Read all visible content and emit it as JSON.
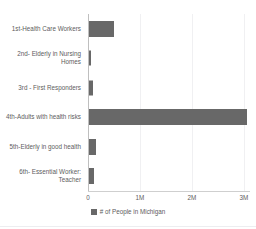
{
  "chart_data": {
    "type": "bar",
    "orientation": "horizontal",
    "title": "",
    "xlabel": "",
    "ylabel": "",
    "categories": [
      "1st-Health Care Workers",
      "2nd- Elderly in Nursing Homes",
      "3rd - First Responders",
      "4th-Adults with health risks",
      "5th-Elderly in good health",
      "6th- Essential Worker: Teacher"
    ],
    "values": [
      480000,
      40000,
      75000,
      3050000,
      135000,
      95000
    ],
    "series": [
      {
        "name": "# of People in Michigan",
        "values": [
          480000,
          40000,
          75000,
          3050000,
          135000,
          95000
        ],
        "color": "#686868"
      }
    ],
    "xlim": [
      0,
      3120000
    ],
    "xticks": [
      0,
      1000000,
      2000000,
      3000000
    ],
    "xtick_labels": [
      "0",
      "1M",
      "2M",
      "3M"
    ],
    "grid": true,
    "grid_axis": "x",
    "legend": [
      "# of People in Michigan"
    ],
    "legend_position": "bottom-center"
  },
  "axis": {
    "ticks": [
      {
        "label": "0",
        "value": 0
      },
      {
        "label": "1M",
        "value": 1000000
      },
      {
        "label": "2M",
        "value": 2000000
      },
      {
        "label": "3M",
        "value": 3000000
      }
    ]
  },
  "legend": {
    "items": [
      {
        "label": "# of People in Michigan",
        "color": "#686868"
      }
    ]
  },
  "colors": {
    "bar": "#686868",
    "text": "#5d5d60",
    "grid": "#f0f0f2",
    "axis": "#bfbfbf",
    "background": "#ffffff"
  },
  "title_sliver": {
    "text": ""
  }
}
